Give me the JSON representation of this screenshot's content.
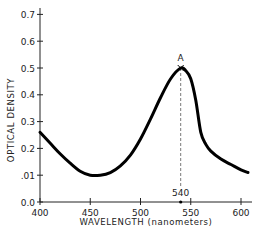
{
  "chart_data": {
    "type": "line",
    "title": "",
    "xlabel": "WAVELENGTH (nanometers)",
    "ylabel": "OPTICAL DENSITY",
    "xlim": [
      400,
      610
    ],
    "ylim": [
      0.0,
      0.7
    ],
    "x_ticks": [
      400,
      450,
      500,
      550,
      600
    ],
    "x_tick_labels": [
      "400",
      "450",
      "500",
      "550",
      "600"
    ],
    "y_ticks": [
      0.0,
      0.1,
      0.2,
      0.3,
      0.4,
      0.5,
      0.6,
      0.7
    ],
    "y_tick_labels": [
      "0.0",
      ".01",
      "0.2",
      "0.3",
      "0.4",
      "0.5",
      "0.6",
      "0.7"
    ],
    "grid": false,
    "legend": null,
    "series": [
      {
        "name": "absorption spectrum",
        "x": [
          400,
          410,
          420,
          430,
          440,
          450,
          460,
          470,
          480,
          490,
          500,
          510,
          520,
          530,
          540,
          545,
          550,
          555,
          560,
          565,
          570,
          580,
          590,
          600,
          607
        ],
        "y": [
          0.26,
          0.22,
          0.18,
          0.145,
          0.115,
          0.1,
          0.1,
          0.11,
          0.135,
          0.175,
          0.235,
          0.31,
          0.39,
          0.46,
          0.5,
          0.49,
          0.46,
          0.38,
          0.26,
          0.215,
          0.19,
          0.16,
          0.14,
          0.12,
          0.11
        ]
      }
    ],
    "annotations": [
      {
        "label": "A",
        "x": 540,
        "y": 0.5,
        "marker": "x"
      },
      {
        "label": "540",
        "x": 540,
        "y": 0.0,
        "type": "dashed vertical line to peak"
      }
    ]
  }
}
